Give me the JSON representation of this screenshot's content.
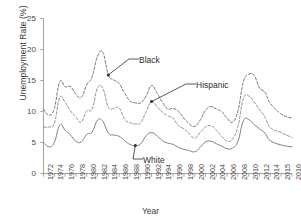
{
  "chart_data": {
    "type": "line",
    "title": "",
    "xlabel": "Year",
    "ylabel": "Unemployment Rate (%)",
    "xlim": [
      1972,
      2016
    ],
    "ylim": [
      0,
      25
    ],
    "yticks": [
      0,
      5,
      10,
      15,
      20,
      25
    ],
    "grid": false,
    "legend_position": "inline-annotations",
    "xticks": [
      "1972",
      "1974",
      "1976",
      "1978",
      "1980",
      "1982",
      "1984",
      "1986",
      "1988",
      "1990",
      "1992",
      "1994",
      "1996",
      "1998",
      "2000",
      "2002",
      "2004",
      "2006",
      "2008",
      "2010",
      "2012",
      "2014",
      "2015",
      "2016"
    ],
    "x": [
      1972,
      1973,
      1974,
      1975,
      1976,
      1977,
      1978,
      1979,
      1980,
      1981,
      1982,
      1983,
      1984,
      1985,
      1986,
      1987,
      1988,
      1989,
      1990,
      1991,
      1992,
      1993,
      1994,
      1995,
      1996,
      1997,
      1998,
      1999,
      2000,
      2001,
      2002,
      2003,
      2004,
      2005,
      2006,
      2007,
      2008,
      2009,
      2010,
      2011,
      2012,
      2013,
      2014,
      2015,
      2016
    ],
    "series": [
      {
        "name": "Black",
        "style": "dashed",
        "color": "#6e6e6e",
        "values": [
          10.4,
          9.4,
          10.5,
          14.8,
          14.0,
          14.0,
          12.8,
          12.3,
          14.3,
          15.6,
          18.9,
          19.5,
          15.9,
          15.1,
          14.5,
          13.0,
          11.7,
          11.4,
          11.4,
          12.5,
          14.2,
          13.0,
          11.5,
          10.4,
          10.5,
          10.0,
          8.9,
          8.0,
          7.6,
          8.6,
          10.2,
          10.8,
          10.4,
          10.0,
          8.9,
          8.3,
          10.1,
          14.8,
          16.0,
          15.8,
          13.8,
          13.1,
          11.3,
          9.6,
          8.9
        ]
      },
      {
        "name": "Hispanic",
        "style": "dashed",
        "color": "#8a8a8a",
        "values": [
          7.5,
          7.5,
          8.1,
          12.2,
          11.5,
          10.1,
          9.1,
          8.3,
          10.1,
          10.4,
          13.8,
          13.7,
          10.7,
          10.5,
          10.6,
          8.8,
          8.2,
          8.0,
          8.2,
          10.0,
          11.6,
          10.8,
          9.9,
          9.3,
          8.9,
          7.7,
          7.2,
          6.4,
          5.7,
          6.6,
          7.5,
          7.7,
          7.0,
          6.0,
          5.2,
          5.6,
          7.6,
          12.1,
          12.5,
          11.5,
          10.3,
          9.1,
          7.4,
          6.6,
          5.8
        ]
      },
      {
        "name": "White",
        "style": "solid",
        "color": "#7a7a7a",
        "values": [
          5.0,
          4.3,
          5.0,
          7.8,
          7.0,
          6.2,
          5.2,
          5.1,
          6.3,
          6.7,
          8.6,
          8.4,
          6.5,
          6.2,
          6.0,
          5.3,
          4.7,
          4.5,
          4.8,
          6.1,
          6.6,
          6.1,
          5.3,
          4.9,
          4.7,
          4.2,
          3.9,
          3.7,
          3.5,
          4.2,
          5.1,
          5.2,
          4.8,
          4.4,
          4.0,
          4.1,
          5.2,
          8.5,
          8.7,
          7.9,
          7.2,
          6.5,
          5.3,
          4.6,
          4.3
        ]
      }
    ],
    "annotations": [
      {
        "label": "Black",
        "target_x": 1984,
        "target_y": 15.9
      },
      {
        "label": "Hispanic",
        "target_x": 1992,
        "target_y": 11.6
      },
      {
        "label": "White",
        "target_x": 1989,
        "target_y": 4.5
      }
    ]
  }
}
